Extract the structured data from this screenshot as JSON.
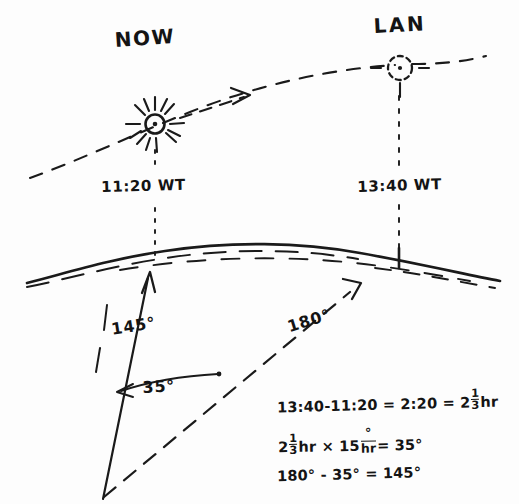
{
  "diagram": {
    "title_sun_now": "NOW",
    "title_sun_lan": "LAN",
    "time_now": "11:20 WT",
    "time_lan": "13:40 WT",
    "angle_bearing": "145°",
    "angle_hour": "35°",
    "angle_reference": "180°",
    "background_color": "#fdfdfd",
    "ink_color": "#1a1a1a"
  },
  "calculations": {
    "line1": {
      "full": "13:40 - 11:20 = 2:20 = 2 1/3 hr",
      "lhs": "13:40-11:20 = 2:20 = 2",
      "frac_num": "1",
      "frac_den": "3",
      "unit": "hr"
    },
    "line2": {
      "full": "2 1/3 hr x 15°/hr = 35°",
      "lead": "2",
      "frac_num": "1",
      "frac_den": "3",
      "mid": "hr × 15",
      "rate_num": "°",
      "rate_den": "hr",
      "result": "= 35°"
    },
    "line3": {
      "full": "180° - 35° = 145°"
    }
  },
  "icons": {
    "sun_now": "sun-icon",
    "sun_lan": "sun-dashed-icon",
    "horizon": "earth-horizon-curve",
    "ecliptic": "sun-path-dashed-arc",
    "arrow_bearing": "bearing-arrow-solid",
    "arrow_reference": "reference-arrow-dashed"
  }
}
